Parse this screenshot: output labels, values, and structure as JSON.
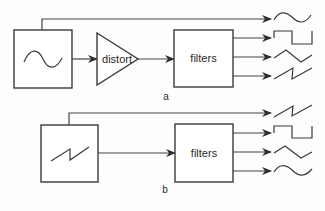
{
  "diagram": {
    "parts": [
      {
        "id": "a",
        "label": "a",
        "source": {
          "name": "oscillator",
          "waveform": "sine"
        },
        "processor": {
          "label": "distort",
          "shape": "triangle"
        },
        "filter": {
          "label": "filters"
        },
        "outputs": [
          {
            "waveform": "sine",
            "from": "source-direct"
          },
          {
            "waveform": "square",
            "from": "filters"
          },
          {
            "waveform": "triangle",
            "from": "filters"
          },
          {
            "waveform": "sawtooth",
            "from": "filters"
          }
        ]
      },
      {
        "id": "b",
        "label": "b",
        "source": {
          "name": "oscillator",
          "waveform": "sawtooth"
        },
        "filter": {
          "label": "filters"
        },
        "outputs": [
          {
            "waveform": "sawtooth",
            "from": "source-direct"
          },
          {
            "waveform": "square",
            "from": "filters"
          },
          {
            "waveform": "triangle",
            "from": "filters"
          },
          {
            "waveform": "sine",
            "from": "filters"
          }
        ]
      }
    ]
  },
  "colors": {
    "stroke": "#3a3a3a",
    "background": "#fdfdfc"
  }
}
